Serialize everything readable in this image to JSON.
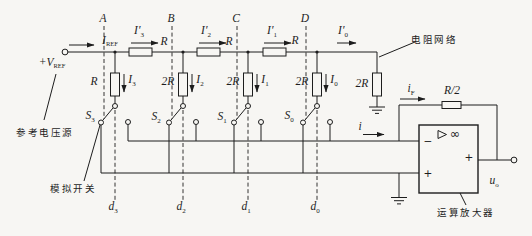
{
  "figure": {
    "background": "#f7f6f3",
    "ink": "#1d1d1d"
  },
  "source": {
    "terminal": {
      "main": "+V",
      "sub": "REF"
    },
    "caption": "参考电压源"
  },
  "ladder": {
    "caption": "电阻网络",
    "input_current": {
      "main": "I",
      "sub": "REF"
    },
    "nodes": [
      "A",
      "B",
      "C",
      "D"
    ],
    "series": [
      {
        "current": {
          "main": "I′",
          "sub": "3"
        },
        "value": "R"
      },
      {
        "current": {
          "main": "I′",
          "sub": "2"
        },
        "value": "R"
      },
      {
        "current": {
          "main": "I′",
          "sub": "1"
        },
        "value": "R"
      }
    ],
    "last_current": {
      "main": "I′",
      "sub": "0"
    },
    "shunts": [
      {
        "value": "R",
        "current": {
          "main": "I",
          "sub": "3"
        }
      },
      {
        "value": "2R",
        "current": {
          "main": "I",
          "sub": "2"
        }
      },
      {
        "value": "2R",
        "current": {
          "main": "I",
          "sub": "1"
        }
      },
      {
        "value": "2R",
        "current": {
          "main": "I",
          "sub": "0"
        }
      }
    ],
    "terminator": "2R"
  },
  "switches": {
    "caption": "模拟开关",
    "items": [
      {
        "name": {
          "main": "S",
          "sub": "3"
        },
        "bit": {
          "main": "d",
          "sub": "3"
        }
      },
      {
        "name": {
          "main": "S",
          "sub": "2"
        },
        "bit": {
          "main": "d",
          "sub": "2"
        }
      },
      {
        "name": {
          "main": "S",
          "sub": "1"
        },
        "bit": {
          "main": "d",
          "sub": "1"
        }
      },
      {
        "name": {
          "main": "S",
          "sub": "0"
        },
        "bit": {
          "main": "d",
          "sub": "0"
        }
      }
    ]
  },
  "summing": {
    "bus_current": {
      "main": "i"
    },
    "feedback_current": {
      "main": "i",
      "sub": "F"
    },
    "feedback_resistor": "R/2"
  },
  "opamp": {
    "caption": "运算放大器",
    "inverting_sign": "−",
    "noninverting_sign": "+",
    "gain": "∞",
    "output_sign": "+",
    "output_voltage": {
      "main": "u",
      "sub": "o"
    }
  }
}
